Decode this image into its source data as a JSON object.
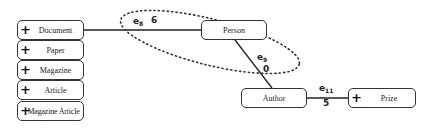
{
  "diagram": {
    "type_list": [
      {
        "label": "Document",
        "expandable": true
      },
      {
        "label": "Paper",
        "expandable": true
      },
      {
        "label": "Magazine",
        "expandable": true
      },
      {
        "label": "Article",
        "expandable": true
      },
      {
        "label": "Magazine Article",
        "expandable": true
      }
    ],
    "nodes": {
      "person": {
        "label": "Person"
      },
      "author": {
        "label": "Author"
      },
      "prize": {
        "label": "Prize",
        "expandable": true
      }
    },
    "edges": [
      {
        "id": "e8",
        "name": "e",
        "sub": "8",
        "weight": "6",
        "from": "Document",
        "to": "Person"
      },
      {
        "id": "e9",
        "name": "e",
        "sub": "9",
        "weight": "0",
        "from": "Person",
        "to": "Author"
      },
      {
        "id": "e11",
        "name": "e",
        "sub": "11",
        "weight": "5",
        "from": "Author",
        "to": "Prize"
      }
    ],
    "plus_glyph": "+",
    "highlight": "dotted-ellipse around e8 and e9"
  }
}
